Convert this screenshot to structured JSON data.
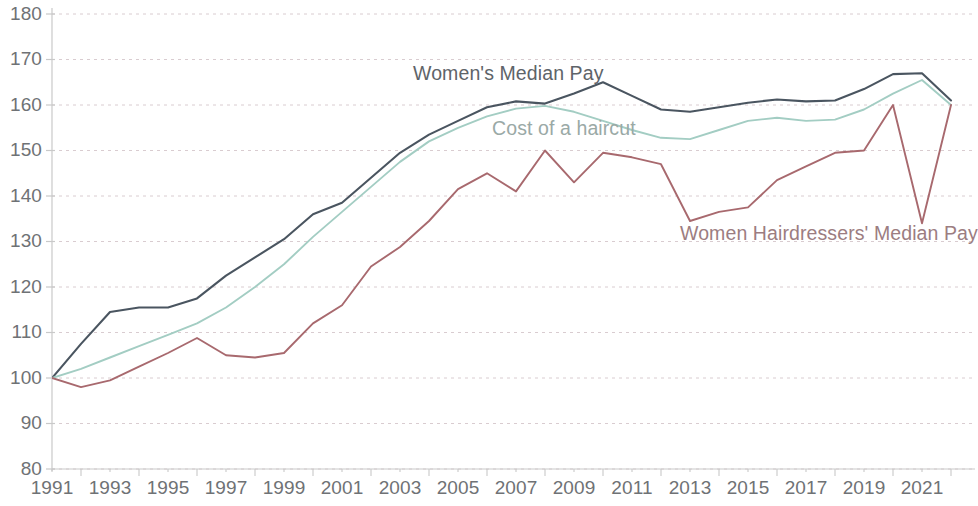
{
  "chart_data": {
    "type": "line",
    "title": "",
    "subtitle": "",
    "xlabel": "",
    "ylabel": "",
    "xlim": [
      1991,
      2022
    ],
    "ylim": [
      80,
      180
    ],
    "grid": true,
    "grid_axis": "y",
    "legend_position": "inline-annotations",
    "index_note": "Index, 1991 = 100",
    "y_ticks": [
      80,
      90,
      100,
      110,
      120,
      130,
      140,
      150,
      160,
      170,
      180
    ],
    "x_ticks_major": [
      1991,
      1993,
      1995,
      1997,
      1999,
      2001,
      2003,
      2005,
      2007,
      2009,
      2011,
      2013,
      2015,
      2017,
      2019,
      2021
    ],
    "x_ticks_minor": [
      1992,
      1994,
      1996,
      1998,
      2000,
      2002,
      2004,
      2006,
      2008,
      2010,
      2012,
      2014,
      2016,
      2018,
      2020,
      2022
    ],
    "x": [
      1991,
      1992,
      1993,
      1994,
      1995,
      1996,
      1997,
      1998,
      1999,
      2000,
      2001,
      2002,
      2003,
      2004,
      2005,
      2006,
      2007,
      2008,
      2009,
      2010,
      2011,
      2012,
      2013,
      2014,
      2015,
      2016,
      2017,
      2018,
      2019,
      2020,
      2021,
      2022
    ],
    "series": [
      {
        "name": "Women's Median Pay",
        "color": "#4a5560",
        "values": [
          100,
          107.5,
          114.5,
          115.5,
          115.5,
          117.5,
          122.5,
          126.5,
          130.5,
          136,
          138.5,
          144,
          149.5,
          153.5,
          156.5,
          159.5,
          160.8,
          160.3,
          162.5,
          165,
          162,
          159,
          158.5,
          159.5,
          160.5,
          161.2,
          160.8,
          161,
          163.5,
          166.8,
          167,
          161
        ]
      },
      {
        "name": "Cost of a haircut",
        "color": "#a3cdc3",
        "values": [
          100,
          102,
          104.5,
          107,
          109.5,
          112,
          115.5,
          120,
          125,
          131,
          136.5,
          142,
          147.5,
          152,
          155,
          157.5,
          159.2,
          159.8,
          158.5,
          156.5,
          154.5,
          152.8,
          152.5,
          154.5,
          156.5,
          157.2,
          156.5,
          156.8,
          159,
          162.5,
          165.5,
          160
        ]
      },
      {
        "name": "Women Hairdressers' Median Pay",
        "color": "#a8696e",
        "values": [
          100,
          98,
          99.5,
          102.5,
          105.5,
          108.8,
          105,
          104.5,
          105.5,
          112,
          116,
          124.5,
          128.8,
          134.5,
          141.5,
          145,
          141,
          150,
          143,
          149.5,
          148.5,
          147,
          134.5,
          136.5,
          137.5,
          143.5,
          146.5,
          149.5,
          150,
          160,
          134,
          160
        ]
      }
    ]
  },
  "axis": {
    "y_labels": [
      "180",
      "170",
      "160",
      "150",
      "140",
      "130",
      "120",
      "110",
      "100",
      "90",
      "80"
    ],
    "x_labels": [
      "1991",
      "1993",
      "1995",
      "1997",
      "1999",
      "2001",
      "2003",
      "2005",
      "2007",
      "2009",
      "2011",
      "2013",
      "2015",
      "2017",
      "2019",
      "2021"
    ]
  },
  "annotations": {
    "women_pay": "Women's Median Pay",
    "haircut": "Cost of a haircut",
    "hairdressers": "Women Hairdressers' Median Pay"
  },
  "colors": {
    "women_pay_line": "#4a5560",
    "haircut_line": "#a3cdc3",
    "hairdressers_line": "#a8696e",
    "gridline": "#d9ccd0",
    "axis_line": "#c9c9c9",
    "tick_text": "#6f7275",
    "background": "#ffffff"
  }
}
